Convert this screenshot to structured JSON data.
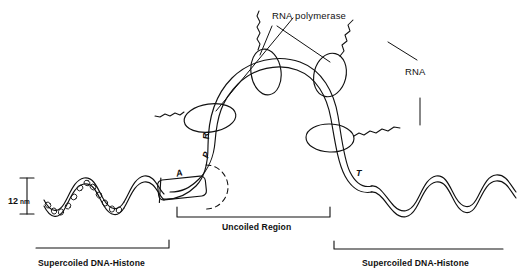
{
  "figure": {
    "title_label": "RNA polymerase",
    "rna_label": "RNA",
    "uncoiled_label": "Uncoiled Region",
    "supercoiled_left_label": "Supercoiled DNA-Histone",
    "supercoiled_right_label": "Supercoiled DNA-Histone",
    "scale": {
      "value": "12",
      "unit": "nm"
    },
    "sites": [
      {
        "id": "A",
        "label": "A"
      },
      {
        "id": "P",
        "label": "P"
      },
      {
        "id": "R",
        "label": "R"
      },
      {
        "id": "T",
        "label": "T"
      }
    ],
    "colors": {
      "ink": "#111111",
      "background": "#ffffff"
    }
  }
}
